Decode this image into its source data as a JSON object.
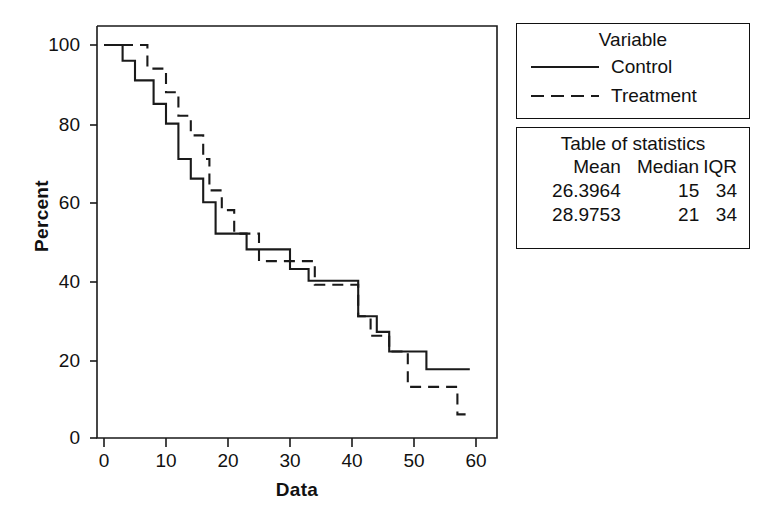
{
  "chart_data": {
    "type": "line",
    "subtype": "survival-step-function",
    "title": "",
    "xlabel": "Data",
    "ylabel": "Percent",
    "xlim": [
      0,
      62
    ],
    "ylim": [
      0,
      100
    ],
    "xticks": [
      0,
      10,
      20,
      30,
      40,
      50,
      60
    ],
    "yticks": [
      0,
      20,
      40,
      60,
      80,
      100
    ],
    "grid": false,
    "legend_position": "right",
    "legend_title": "Variable",
    "series": [
      {
        "name": "Control",
        "linestyle": "solid",
        "color": "#1a1a1a",
        "points": [
          [
            0,
            100
          ],
          [
            3,
            100
          ],
          [
            3,
            96
          ],
          [
            5,
            96
          ],
          [
            5,
            91
          ],
          [
            8,
            91
          ],
          [
            8,
            85
          ],
          [
            10,
            85
          ],
          [
            10,
            80
          ],
          [
            12,
            80
          ],
          [
            12,
            71
          ],
          [
            14,
            71
          ],
          [
            14,
            66
          ],
          [
            16,
            66
          ],
          [
            16,
            60
          ],
          [
            18,
            60
          ],
          [
            18,
            52
          ],
          [
            23,
            52
          ],
          [
            23,
            48
          ],
          [
            30,
            48
          ],
          [
            30,
            43
          ],
          [
            33,
            43
          ],
          [
            33,
            40
          ],
          [
            41,
            40
          ],
          [
            41,
            31
          ],
          [
            44,
            31
          ],
          [
            44,
            27
          ],
          [
            46,
            27
          ],
          [
            46,
            22
          ],
          [
            52,
            22
          ],
          [
            52,
            17.5
          ],
          [
            59,
            17.5
          ]
        ]
      },
      {
        "name": "Treatment",
        "linestyle": "dashed",
        "color": "#1a1a1a",
        "points": [
          [
            0,
            100
          ],
          [
            7,
            100
          ],
          [
            7,
            94
          ],
          [
            10,
            94
          ],
          [
            10,
            88
          ],
          [
            12,
            88
          ],
          [
            12,
            82
          ],
          [
            14,
            82
          ],
          [
            14,
            77
          ],
          [
            16,
            77
          ],
          [
            16,
            71
          ],
          [
            17,
            71
          ],
          [
            17,
            63
          ],
          [
            19,
            63
          ],
          [
            19,
            58
          ],
          [
            21,
            58
          ],
          [
            21,
            52
          ],
          [
            25,
            52
          ],
          [
            25,
            45
          ],
          [
            34,
            45
          ],
          [
            34,
            39
          ],
          [
            41,
            39
          ],
          [
            41,
            31
          ],
          [
            43,
            31
          ],
          [
            43,
            26
          ],
          [
            46,
            26
          ],
          [
            46,
            22
          ],
          [
            49,
            22
          ],
          [
            49,
            13
          ],
          [
            57,
            13
          ],
          [
            57,
            6
          ],
          [
            59,
            6
          ]
        ]
      }
    ],
    "stats_table": {
      "title": "Table of statistics",
      "columns": [
        "Mean",
        "Median",
        "IQR"
      ],
      "rows": [
        [
          "26.3964",
          "15",
          "34"
        ],
        [
          "28.9753",
          "21",
          "34"
        ]
      ]
    }
  },
  "axes": {
    "y_title": "Percent",
    "x_title": "Data",
    "y_tick_labels": [
      "100",
      "80",
      "60",
      "40",
      "20",
      "0"
    ],
    "x_tick_labels": [
      "0",
      "10",
      "20",
      "30",
      "40",
      "50",
      "60"
    ]
  },
  "legend": {
    "title": "Variable",
    "items": [
      {
        "label": "Control",
        "style": "solid"
      },
      {
        "label": "Treatment",
        "style": "dashed"
      }
    ]
  },
  "stats": {
    "title": "Table of statistics",
    "headers": {
      "mean": "Mean",
      "median": "Median",
      "iqr": "IQR"
    },
    "rows": [
      {
        "mean": "26.3964",
        "median": "15",
        "iqr": "34"
      },
      {
        "mean": "28.9753",
        "median": "21",
        "iqr": "34"
      }
    ]
  },
  "caption_remnant": " "
}
